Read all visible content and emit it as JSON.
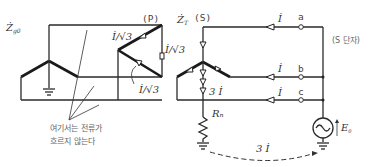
{
  "labels": {
    "z_g0": "Ż",
    "z_g0_sub": "g0",
    "primary": "(P)",
    "z_t": "Ż",
    "z_t_sub": "T",
    "secondary": "(S)",
    "delta_current_top": "İ/√3",
    "delta_current_right": "İ/√3",
    "delta_current_diag": "İ/√3",
    "neutral_current": "3 İ",
    "line_current_a": "İ",
    "line_current_b": "İ",
    "line_current_c": "İ",
    "terminal_a": "a",
    "terminal_b": "b",
    "terminal_c": "c",
    "s_terminal": "(S 단자)",
    "resistor": "Rₙ",
    "source": "E",
    "source_sub": "0",
    "return_current": "3 İ",
    "note_line1": "여기서는 전류가",
    "note_line2": "흐르지 않는다"
  }
}
